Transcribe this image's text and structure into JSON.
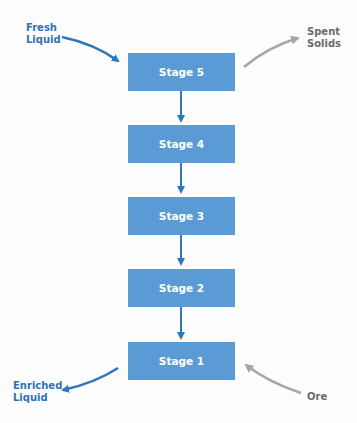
{
  "diagram": {
    "type": "countercurrent-flow",
    "stages": [
      {
        "label": "Stage 5"
      },
      {
        "label": "Stage 4"
      },
      {
        "label": "Stage 3"
      },
      {
        "label": "Stage 2"
      },
      {
        "label": "Stage 1"
      }
    ],
    "inputs": {
      "top_left": {
        "line1": "Fresh",
        "line2": "Liquid"
      },
      "bottom_right": {
        "line1": "Ore"
      }
    },
    "outputs": {
      "top_right": {
        "line1": "Spent",
        "line2": "Solids"
      },
      "bottom_left": {
        "line1": "Enriched",
        "line2": "Liquid"
      }
    },
    "colors": {
      "stage_fill": "#5b9bd5",
      "liquid_arrow": "#2b78bf",
      "solid_arrow": "#a3a6aa",
      "liquid_label": "#2f72b4",
      "solid_label": "#6a6a6a"
    }
  }
}
